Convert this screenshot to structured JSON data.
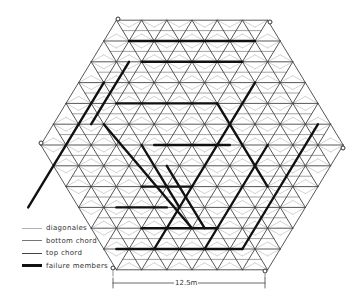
{
  "diagram": {
    "type": "hexagonal space truss plan",
    "dimension_label": "12.5m",
    "colors": {
      "diagonals": "#b5b5b5",
      "bottom_chord": "#7a7a7a",
      "top_chord": "#444444",
      "failure_members": "#111111",
      "node": "#333333"
    }
  },
  "legend": {
    "items": [
      {
        "label": "diagonales",
        "style": "diagonals"
      },
      {
        "label": "bottom chord",
        "style": "bottom_chord"
      },
      {
        "label": "top chord",
        "style": "top_chord"
      },
      {
        "label": "failure members",
        "style": "failure_members"
      }
    ]
  },
  "supports": [
    {
      "x": 118,
      "y": 19
    },
    {
      "x": 270,
      "y": 22
    },
    {
      "x": 41,
      "y": 143
    },
    {
      "x": 343,
      "y": 148
    },
    {
      "x": 113,
      "y": 268
    },
    {
      "x": 265,
      "y": 271
    }
  ]
}
